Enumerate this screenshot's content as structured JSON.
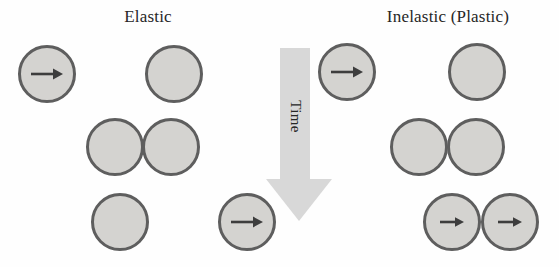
{
  "figure": {
    "left_panel_title": "Elastic",
    "right_panel_title": "Inelastic (Plastic)",
    "time_label": "Time"
  },
  "icons": {
    "velocity_arrow": "right-arrow",
    "time_arrow": "down-arrow"
  },
  "colors": {
    "background": "#fefefe",
    "ball_fill": "#d4d3d0",
    "ball_border": "#5e5e5e",
    "velocity_arrow": "#3d3d3d",
    "time_arrow_fill": "#d8d8d8",
    "text": "#262626"
  }
}
